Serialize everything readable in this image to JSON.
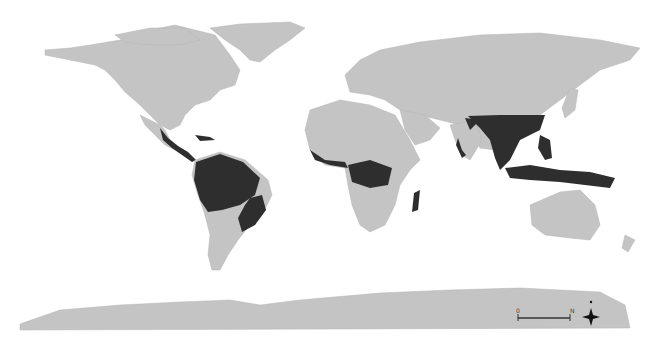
{
  "map": {
    "type": "world map",
    "projection": "equirectangular",
    "land_color": "#c4c4c4",
    "highlight_color": "#2e2e2e",
    "background_color": "#ffffff",
    "highlight_meaning": "tropical forest regions",
    "highlighted_regions": [
      "Central America",
      "Amazon Basin",
      "Atlantic Forest",
      "West Africa",
      "Congo Basin",
      "Madagascar",
      "India Western Ghats",
      "Southeast Asia",
      "Indonesia",
      "Papua New Guinea"
    ],
    "scale_bar": {
      "start_label": "0",
      "end_label": "N"
    },
    "north_arrow": {
      "label": "N"
    }
  }
}
